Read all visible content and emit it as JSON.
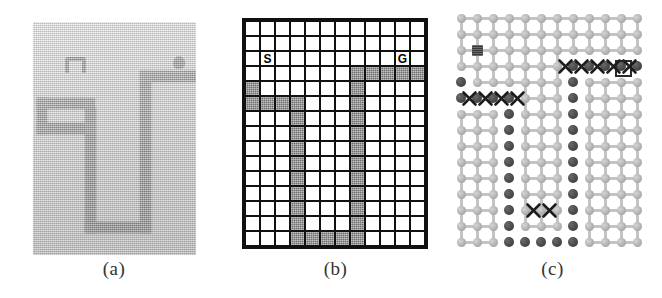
{
  "figure": {
    "panels": [
      {
        "id": "a",
        "caption": "(a)",
        "kind": "photograph",
        "description": "photographic view of a physical maze environment",
        "background_color": "#cfcfcf",
        "wall_color": "#5b5b5b",
        "markers": [
          {
            "name": "start-marker",
            "shape": "n-bracket"
          },
          {
            "name": "goal-marker",
            "shape": "blob"
          }
        ]
      },
      {
        "id": "b",
        "caption": "(b)",
        "kind": "grid",
        "rows": 15,
        "cols": 12,
        "cell_size": 13,
        "free_color": "#ffffff",
        "blocked_color": "#6e6e6e",
        "line_color": "#111111",
        "start_label": "S",
        "goal_label": "G",
        "start_cell": [
          2,
          1
        ],
        "goal_cell": [
          2,
          10
        ],
        "blocked_cells": [
          [
            3,
            7
          ],
          [
            3,
            8
          ],
          [
            3,
            9
          ],
          [
            3,
            10
          ],
          [
            3,
            11
          ],
          [
            4,
            0
          ],
          [
            4,
            7
          ],
          [
            5,
            0
          ],
          [
            5,
            1
          ],
          [
            5,
            2
          ],
          [
            5,
            3
          ],
          [
            5,
            7
          ],
          [
            6,
            3
          ],
          [
            6,
            7
          ],
          [
            7,
            3
          ],
          [
            7,
            7
          ],
          [
            8,
            3
          ],
          [
            8,
            7
          ],
          [
            9,
            3
          ],
          [
            9,
            7
          ],
          [
            10,
            3
          ],
          [
            10,
            7
          ],
          [
            11,
            3
          ],
          [
            11,
            7
          ],
          [
            12,
            3
          ],
          [
            12,
            7
          ],
          [
            13,
            3
          ],
          [
            13,
            7
          ],
          [
            14,
            3
          ],
          [
            14,
            4
          ],
          [
            14,
            5
          ],
          [
            14,
            6
          ],
          [
            14,
            7
          ]
        ]
      },
      {
        "id": "c",
        "caption": "(c)",
        "kind": "lattice-graph",
        "rows": 15,
        "cols": 12,
        "spacing_x": 16,
        "spacing_y": 16,
        "node_color": "#b4b4b4",
        "obstacle_color": "#4d4d4d",
        "edge_color": "#c4c4c4",
        "mark_color": "#1d1d1d",
        "start_node": [
          2,
          1
        ],
        "goal_node": [
          3,
          10
        ],
        "obstacle_nodes": [
          [
            3,
            7
          ],
          [
            3,
            8
          ],
          [
            3,
            9
          ],
          [
            3,
            10
          ],
          [
            3,
            11
          ],
          [
            4,
            0
          ],
          [
            4,
            7
          ],
          [
            5,
            0
          ],
          [
            5,
            1
          ],
          [
            5,
            2
          ],
          [
            5,
            3
          ],
          [
            5,
            7
          ],
          [
            6,
            3
          ],
          [
            6,
            7
          ],
          [
            7,
            3
          ],
          [
            7,
            7
          ],
          [
            8,
            3
          ],
          [
            8,
            7
          ],
          [
            9,
            3
          ],
          [
            9,
            7
          ],
          [
            10,
            3
          ],
          [
            10,
            7
          ],
          [
            11,
            3
          ],
          [
            11,
            7
          ],
          [
            12,
            3
          ],
          [
            12,
            7
          ],
          [
            13,
            3
          ],
          [
            13,
            7
          ],
          [
            14,
            3
          ],
          [
            14,
            4
          ],
          [
            14,
            5
          ],
          [
            14,
            6
          ],
          [
            14,
            7
          ]
        ],
        "cut_edge_marks": [
          {
            "row": 3,
            "col": 6.5,
            "label": "x"
          },
          {
            "row": 3,
            "col": 7.5,
            "label": "x"
          },
          {
            "row": 3,
            "col": 8.5,
            "label": "x"
          },
          {
            "row": 3,
            "col": 9.5,
            "label": "x"
          },
          {
            "row": 3,
            "col": 10.5,
            "label": "x"
          },
          {
            "row": 5,
            "col": 0.5,
            "label": "x"
          },
          {
            "row": 5,
            "col": 1.5,
            "label": "x"
          },
          {
            "row": 5,
            "col": 2.5,
            "label": "x"
          },
          {
            "row": 5,
            "col": 3.5,
            "label": "x"
          },
          {
            "row": 12,
            "col": 4.5,
            "label": "x"
          },
          {
            "row": 12,
            "col": 5.5,
            "label": "x"
          }
        ]
      }
    ]
  }
}
